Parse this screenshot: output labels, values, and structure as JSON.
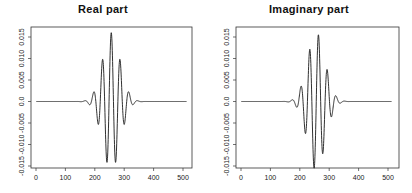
{
  "chart_data": [
    {
      "type": "line",
      "title": "Real part",
      "xlabel": "",
      "ylabel": "",
      "xlim": [
        0,
        512
      ],
      "ylim": [
        -0.016,
        0.0165
      ],
      "xticks": [
        0,
        100,
        200,
        300,
        400,
        500
      ],
      "xtick_labels": [
        "0",
        "100",
        "200",
        "300",
        "400",
        "500"
      ],
      "yticks": [
        -0.015,
        -0.01,
        -0.005,
        0.0,
        0.005,
        0.01,
        0.015
      ],
      "ytick_labels": [
        "-0.015",
        "-0.010",
        "-0.005",
        "0.0",
        "0.005",
        "0.010",
        "0.015"
      ],
      "grid": false,
      "legend": null,
      "series": [
        {
          "name": "Real part",
          "generator": "gabor",
          "function": "cos",
          "center": 256,
          "amplitude": 0.016,
          "sigma": 30,
          "period": 30,
          "phase": 0,
          "n": 512,
          "x_range": [
            1,
            512
          ],
          "peaks_sample": [
            {
              "x": 256,
              "y": 0.016
            },
            {
              "x": 241,
              "y": -0.015
            },
            {
              "x": 271,
              "y": -0.015
            },
            {
              "x": 226,
              "y": 0.0115
            },
            {
              "x": 286,
              "y": 0.0115
            },
            {
              "x": 211,
              "y": -0.008
            },
            {
              "x": 301,
              "y": -0.008
            },
            {
              "x": 196,
              "y": 0.004
            },
            {
              "x": 316,
              "y": 0.004
            }
          ]
        }
      ]
    },
    {
      "type": "line",
      "title": "Imaginary part",
      "xlabel": "",
      "ylabel": "",
      "xlim": [
        0,
        512
      ],
      "ylim": [
        -0.016,
        0.0165
      ],
      "xticks": [
        0,
        100,
        200,
        300,
        400,
        500
      ],
      "xtick_labels": [
        "0",
        "100",
        "200",
        "300",
        "400",
        "500"
      ],
      "yticks": [
        -0.015,
        -0.01,
        -0.005,
        0.0,
        0.005,
        0.01,
        0.015
      ],
      "ytick_labels": [
        "-0.015",
        "-0.010",
        "-0.005",
        "0.0",
        "0.005",
        "0.010",
        "0.015"
      ],
      "grid": false,
      "legend": null,
      "series": [
        {
          "name": "Imaginary part",
          "generator": "gabor",
          "function": "sin",
          "center": 256,
          "amplitude": 0.016,
          "sigma": 30,
          "period": 30,
          "phase": 0,
          "n": 512,
          "x_range": [
            1,
            512
          ],
          "peaks_sample": [
            {
              "x": 263,
              "y": 0.0155
            },
            {
              "x": 248,
              "y": -0.0155
            },
            {
              "x": 233,
              "y": 0.0133
            },
            {
              "x": 278,
              "y": -0.0133
            },
            {
              "x": 218,
              "y": -0.0095
            },
            {
              "x": 293,
              "y": 0.0095
            },
            {
              "x": 203,
              "y": 0.006
            },
            {
              "x": 308,
              "y": -0.006
            }
          ]
        }
      ]
    }
  ],
  "panels": [
    {
      "title": "Real part"
    },
    {
      "title": "Imaginary part"
    }
  ],
  "colors": {
    "line": "#1a1a1a",
    "axis": "#333333",
    "background": "#ffffff"
  }
}
